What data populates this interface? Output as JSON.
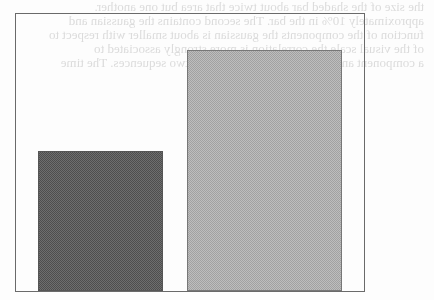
{
  "ghost_text": {
    "lines": [
      "the size of the shaded bar about twice that area but one another.",
      "approximately 10% in the bar. The second contains the gaussian and",
      "function of the components the gaussian is about smaller with respect to",
      "of the visual scale the correlation is more strongly associated to",
      "a component and are significantly more than two sequences. The time"
    ]
  },
  "colors": {
    "frame": "#6a6a6a",
    "bar_dark": "#6e6e6e",
    "bar_light": "#bdbdbd",
    "background": "#fdfdfd"
  },
  "chart_data": {
    "type": "bar",
    "title": "",
    "xlabel": "",
    "ylabel": "",
    "categories": [
      "A",
      "B"
    ],
    "values": [
      58,
      100
    ],
    "colors": [
      "#6e6e6e",
      "#bdbdbd"
    ],
    "ylim": [
      0,
      115
    ],
    "grid": false,
    "legend": null
  }
}
